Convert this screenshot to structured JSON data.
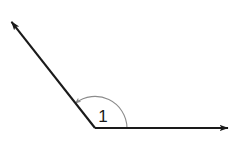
{
  "figure": {
    "type": "geometry-angle-diagram",
    "background_color": "#ffffff",
    "width": 231,
    "height": 145,
    "stroke_color": "#1a1a1a",
    "arc_color": "#8c8c8c",
    "label": "1",
    "label_position": {
      "x": 103,
      "y": 122
    },
    "vertex": {
      "x": 95,
      "y": 128
    },
    "rays": [
      {
        "name": "horizontal-ray",
        "from": {
          "x": 95,
          "y": 128
        },
        "to": {
          "x": 229,
          "y": 128
        },
        "arrowhead": "end",
        "angle_degrees": 0
      },
      {
        "name": "diagonal-ray",
        "from": {
          "x": 95,
          "y": 128
        },
        "to": {
          "x": 10,
          "y": 20
        },
        "arrowhead": "end",
        "angle_degrees": 128
      }
    ],
    "arc": {
      "name": "angle-arc",
      "radius": 32,
      "start_angle_degrees": 0,
      "end_angle_degrees": 128,
      "arrowhead": "start-of-diagonal-end",
      "color": "#8c8c8c"
    }
  }
}
